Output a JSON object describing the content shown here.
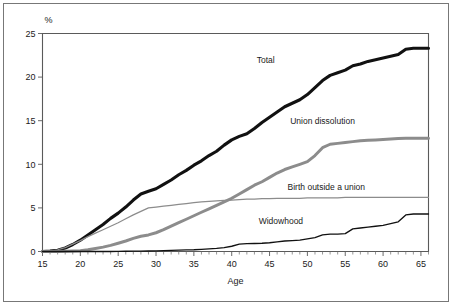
{
  "figure": {
    "unit_label": "%",
    "x_axis_title": "Age"
  },
  "chart_data": {
    "type": "line",
    "title": "",
    "xlabel": "Age",
    "ylabel": "%",
    "xlim": [
      15,
      66
    ],
    "ylim": [
      0,
      25
    ],
    "xticks": [
      15,
      20,
      25,
      30,
      35,
      40,
      45,
      50,
      55,
      60,
      65
    ],
    "yticks": [
      0,
      5,
      10,
      15,
      20,
      25
    ],
    "xtick_labels": [
      "15",
      "20",
      "25",
      "30",
      "35",
      "40",
      "45",
      "50",
      "55",
      "60",
      "65"
    ],
    "ytick_labels": [
      "0",
      "5",
      "10",
      "15",
      "20",
      "25"
    ],
    "minor_xtick_step": 1,
    "grid": false,
    "legend": "inline-labels",
    "x": [
      15,
      16,
      17,
      18,
      19,
      20,
      21,
      22,
      23,
      24,
      25,
      26,
      27,
      28,
      29,
      30,
      31,
      32,
      33,
      34,
      35,
      36,
      37,
      38,
      39,
      40,
      41,
      42,
      43,
      44,
      45,
      46,
      47,
      48,
      49,
      50,
      51,
      52,
      53,
      54,
      55,
      56,
      57,
      58,
      59,
      60,
      61,
      62,
      63,
      64,
      65,
      66
    ],
    "series": [
      {
        "name": "Total",
        "color": "#111111",
        "label_x": 44.5,
        "label_y": 21.6,
        "values": [
          0.0,
          0.05,
          0.15,
          0.4,
          0.8,
          1.3,
          1.9,
          2.5,
          3.1,
          3.8,
          4.4,
          5.1,
          5.9,
          6.6,
          6.9,
          7.2,
          7.7,
          8.2,
          8.8,
          9.3,
          9.9,
          10.4,
          11.0,
          11.5,
          12.2,
          12.8,
          13.2,
          13.5,
          14.1,
          14.8,
          15.4,
          16.0,
          16.6,
          17.0,
          17.4,
          18.0,
          18.8,
          19.6,
          20.2,
          20.5,
          20.8,
          21.3,
          21.5,
          21.8,
          22.0,
          22.2,
          22.4,
          22.6,
          23.2,
          23.3,
          23.3,
          23.3
        ]
      },
      {
        "name": "Union dissolution",
        "color": "#8c8c8c",
        "label_x": 52.0,
        "label_y": 14.6,
        "values": [
          0.0,
          0.0,
          0.0,
          0.02,
          0.05,
          0.1,
          0.2,
          0.35,
          0.5,
          0.7,
          0.95,
          1.2,
          1.5,
          1.75,
          1.9,
          2.15,
          2.5,
          2.9,
          3.3,
          3.7,
          4.1,
          4.5,
          4.9,
          5.3,
          5.7,
          6.1,
          6.6,
          7.1,
          7.6,
          8.0,
          8.5,
          9.0,
          9.4,
          9.7,
          10.0,
          10.3,
          11.0,
          11.9,
          12.3,
          12.4,
          12.5,
          12.6,
          12.7,
          12.75,
          12.8,
          12.85,
          12.9,
          12.95,
          13.0,
          13.0,
          13.0,
          13.0
        ]
      },
      {
        "name": "Birth outside a union",
        "color": "#8c8c8c",
        "label_x": 52.5,
        "label_y": 7.1,
        "values": [
          0.0,
          0.05,
          0.2,
          0.45,
          0.85,
          1.25,
          1.7,
          2.1,
          2.5,
          2.9,
          3.3,
          3.75,
          4.2,
          4.6,
          5.0,
          5.1,
          5.2,
          5.3,
          5.4,
          5.5,
          5.6,
          5.7,
          5.75,
          5.8,
          5.85,
          5.9,
          5.95,
          6.0,
          6.0,
          6.05,
          6.05,
          6.1,
          6.1,
          6.1,
          6.1,
          6.15,
          6.15,
          6.15,
          6.15,
          6.15,
          6.2,
          6.2,
          6.2,
          6.2,
          6.2,
          6.2,
          6.2,
          6.2,
          6.2,
          6.2,
          6.2,
          6.2
        ]
      },
      {
        "name": "Widowhood",
        "color": "#111111",
        "label_x": 46.5,
        "label_y": 3.1,
        "values": [
          0.0,
          0.0,
          0.0,
          0.0,
          0.0,
          0.0,
          0.0,
          0.0,
          0.0,
          0.0,
          0.02,
          0.03,
          0.04,
          0.05,
          0.06,
          0.08,
          0.1,
          0.12,
          0.15,
          0.18,
          0.2,
          0.25,
          0.3,
          0.35,
          0.45,
          0.6,
          0.85,
          0.9,
          0.92,
          0.95,
          1.0,
          1.1,
          1.2,
          1.25,
          1.3,
          1.45,
          1.6,
          1.9,
          2.0,
          2.0,
          2.05,
          2.6,
          2.7,
          2.8,
          2.9,
          3.0,
          3.2,
          3.4,
          4.2,
          4.3,
          4.3,
          4.3
        ]
      }
    ]
  }
}
